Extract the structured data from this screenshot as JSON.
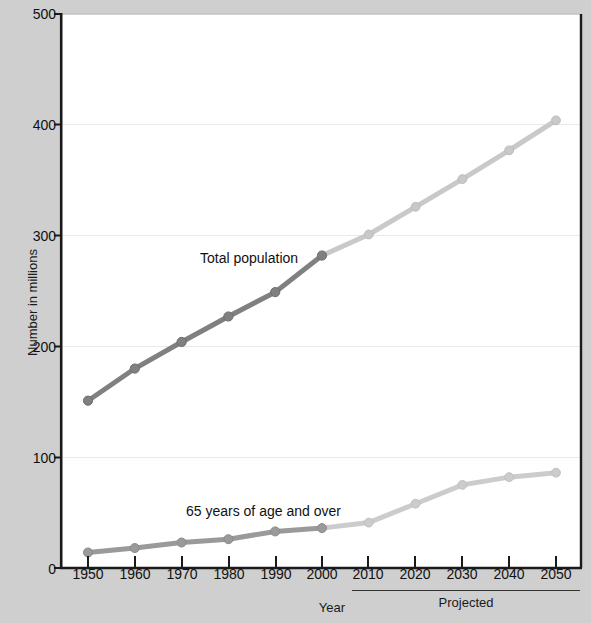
{
  "chart_data": {
    "type": "line",
    "title": "",
    "xlabel": "Year",
    "ylabel": "Number in millions",
    "x": [
      1950,
      1960,
      1970,
      1980,
      1990,
      2000,
      2010,
      2020,
      2030,
      2040,
      2050
    ],
    "xticklabels": [
      "1950",
      "1960",
      "1970",
      "1980",
      "1990",
      "2000",
      "2010",
      "2020",
      "2030",
      "2040",
      "2050"
    ],
    "yticklabels": [
      "0",
      "100",
      "200",
      "300",
      "400",
      "500"
    ],
    "yticks": [
      0,
      100,
      200,
      300,
      400,
      500
    ],
    "ylim": [
      0,
      500
    ],
    "xlim": [
      1950,
      2050
    ],
    "grid": "horizontal",
    "legend": "inline-annotations",
    "series": [
      {
        "name": "Total population",
        "values": [
          151,
          180,
          204,
          227,
          249,
          282,
          301,
          326,
          351,
          377,
          404
        ],
        "color_actual": "#7f7f7f",
        "color_projected": "#c8c8c8",
        "actual_through": 2000
      },
      {
        "name": "65 years of age and over",
        "values": [
          14,
          18,
          23,
          26,
          33,
          36,
          41,
          58,
          75,
          82,
          86
        ],
        "color_actual": "#999999",
        "color_projected": "#cccccc",
        "actual_through": 2000
      }
    ],
    "annotations": [
      {
        "text": "Total population",
        "x": 1978,
        "y": 288
      },
      {
        "text": "65 years of age and over",
        "x": 1975,
        "y": 62
      },
      {
        "text": "Projected",
        "x": 2030,
        "y": -80
      }
    ]
  },
  "axis": {
    "y_title": "Number in millions",
    "x_title": "Year",
    "y_labels": [
      "500",
      "400",
      "300",
      "200",
      "100",
      "0"
    ],
    "x_labels": [
      "1950",
      "1960",
      "1970",
      "1980",
      "1990",
      "2000",
      "2010",
      "2020",
      "2030",
      "2040",
      "2050"
    ]
  },
  "labels": {
    "total_population": "Total population",
    "over_65": "65 years of age and over",
    "projected": "Projected"
  },
  "colors": {
    "background": "#cfcfcf",
    "plot_background": "#ffffff",
    "axis": "#1a1a1a",
    "gridline": "#e8e8e8",
    "total_actual": "#7f7f7f",
    "total_projected": "#c8c8c8",
    "over65_actual": "#999999",
    "over65_projected": "#cccccc"
  }
}
